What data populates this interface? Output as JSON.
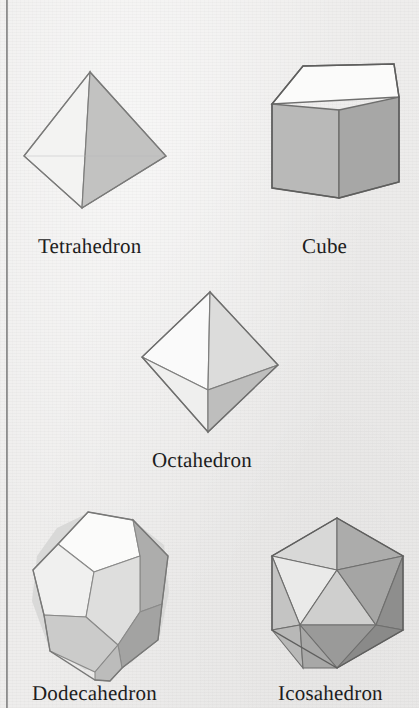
{
  "figure": {
    "background_color": "#eeedec",
    "ink_color": "#1d1d1d",
    "edge_color": "#7b7b7b"
  },
  "gutter": {
    "name": "page-binding-line",
    "color": "#6f6f6f"
  },
  "solids": [
    {
      "id": "tetrahedron",
      "label": "Tetrahedron",
      "faces": 4,
      "face_colors": [
        "#f2f2f1",
        "#c3c3c2",
        "#b5b5b4"
      ]
    },
    {
      "id": "cube",
      "label": "Cube",
      "faces": 6,
      "face_colors": [
        "#fbfbfa",
        "#b9b9b8",
        "#a6a6a5"
      ]
    },
    {
      "id": "octahedron",
      "label": "Octahedron",
      "faces": 8,
      "face_colors": [
        "#fafafa",
        "#dcdcdb",
        "#eeeeed",
        "#bdbdbc"
      ]
    },
    {
      "id": "dodecahedron",
      "label": "Dodecahedron",
      "faces": 12,
      "face_colors": [
        "#fbfbfa",
        "#e2e2e1",
        "#d3d3d2",
        "#c0c0bf",
        "#b0b0af",
        "#a0a09f"
      ]
    },
    {
      "id": "icosahedron",
      "label": "Icosahedron",
      "faces": 20,
      "face_colors": [
        "#eeeeed",
        "#dadad9",
        "#c6c6c5",
        "#b4b4b3",
        "#a2a2a1",
        "#949493",
        "#868685"
      ]
    }
  ],
  "labels": {
    "tetrahedron": "Tetrahedron",
    "cube": "Cube",
    "octahedron": "Octahedron",
    "dodecahedron": "Dodecahedron",
    "icosahedron": "Icosahedron"
  }
}
